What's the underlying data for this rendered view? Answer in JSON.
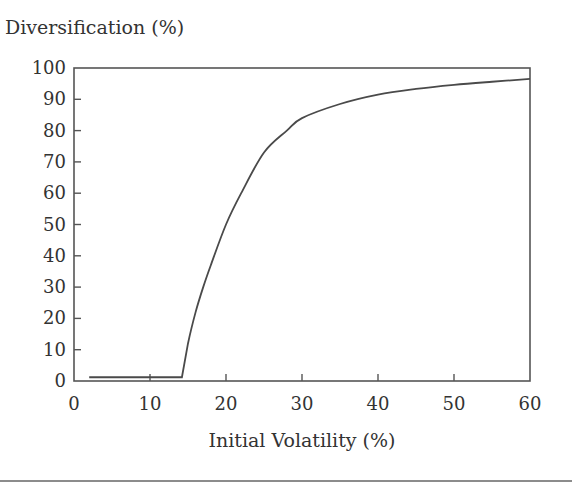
{
  "chart_data": {
    "type": "line",
    "title": "",
    "ylabel": "Diversification (%)",
    "xlabel": "Initial Volatility (%)",
    "xlim": [
      0,
      60
    ],
    "ylim": [
      0,
      100
    ],
    "x_ticks": [
      0,
      10,
      20,
      30,
      40,
      50,
      60
    ],
    "y_ticks": [
      0,
      10,
      20,
      30,
      40,
      50,
      60,
      70,
      80,
      90,
      100
    ],
    "grid": false,
    "legend": null,
    "series": [
      {
        "name": "Diversification",
        "x": [
          2,
          14.2,
          15,
          16,
          17,
          18,
          20,
          22,
          25,
          28,
          30,
          35,
          40,
          45,
          50,
          55,
          60
        ],
        "y": [
          1.2,
          1.2,
          12,
          22,
          30,
          37,
          50,
          60,
          73,
          80,
          84,
          88.5,
          91.5,
          93.3,
          94.6,
          95.6,
          96.5
        ]
      }
    ]
  },
  "style": {
    "line_color": "#4a4a4a",
    "axis_color": "#555555",
    "text_color": "#333333",
    "background": "#ffffff"
  }
}
